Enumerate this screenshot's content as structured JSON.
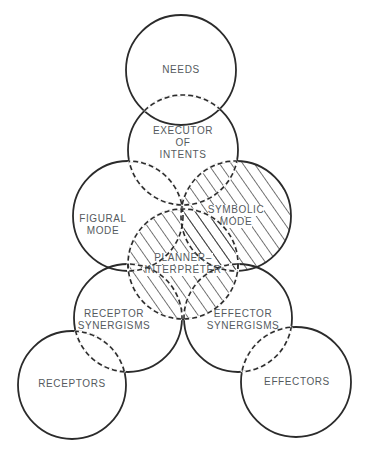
{
  "diagram": {
    "type": "overlapping-circles",
    "stroke_color": "#2b2b2b",
    "text_color": "#555a5e",
    "hatch_color": "#2b2b2b",
    "nodes": [
      {
        "id": "needs",
        "lines": [
          "NEEDS"
        ],
        "cx": 181,
        "cy": 70,
        "r": 55,
        "hatched": false
      },
      {
        "id": "executor",
        "lines": [
          "EXECUTOR",
          "OF",
          "INTENTS"
        ],
        "cx": 183,
        "cy": 150,
        "r": 55,
        "hatched": false
      },
      {
        "id": "figural",
        "lines": [
          "FIGURAL",
          "MODE"
        ],
        "cx": 128,
        "cy": 216,
        "r": 55,
        "hatched": false
      },
      {
        "id": "symbolic",
        "lines": [
          "SYMBOLIC",
          "MODE"
        ],
        "cx": 236,
        "cy": 216,
        "r": 55,
        "hatched": true
      },
      {
        "id": "planner",
        "lines": [
          "PLANNER–",
          "INTERPRETER"
        ],
        "cx": 183,
        "cy": 264,
        "r": 55,
        "hatched": true
      },
      {
        "id": "receptor_syn",
        "lines": [
          "RECEPTOR",
          "SYNERGISMS"
        ],
        "cx": 128,
        "cy": 318,
        "r": 54,
        "hatched": false
      },
      {
        "id": "effector_syn",
        "lines": [
          "EFFECTOR",
          "SYNERGISMS"
        ],
        "cx": 238,
        "cy": 318,
        "r": 54,
        "hatched": false
      },
      {
        "id": "receptors",
        "lines": [
          "RECEPTORS"
        ],
        "cx": 72,
        "cy": 385,
        "r": 54,
        "hatched": false
      },
      {
        "id": "effectors",
        "lines": [
          "EFFECTORS"
        ],
        "cx": 296,
        "cy": 382,
        "r": 55,
        "hatched": false
      }
    ],
    "labels": {
      "needs": "NEEDS",
      "executor_1": "EXECUTOR",
      "executor_2": "OF",
      "executor_3": "INTENTS",
      "figural_1": "FIGURAL",
      "figural_2": "MODE",
      "symbolic_1": "SYMBOLIC",
      "symbolic_2": "MODE",
      "planner_1": "PLANNER–",
      "planner_2": "INTERPRETER",
      "receptor_syn_1": "RECEPTOR",
      "receptor_syn_2": "SYNERGISMS",
      "effector_syn_1": "EFFECTOR",
      "effector_syn_2": "SYNERGISMS",
      "receptors": "RECEPTORS",
      "effectors": "EFFECTORS"
    }
  }
}
